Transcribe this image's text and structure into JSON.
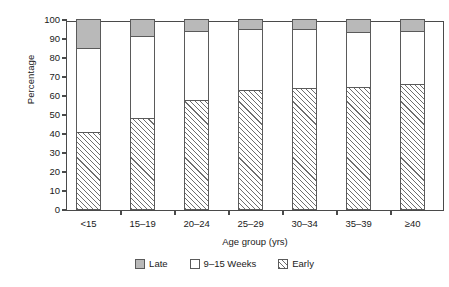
{
  "chart_data": {
    "type": "bar",
    "subtype": "stacked-percentage",
    "title": "",
    "xlabel": "Age group (yrs)",
    "ylabel": "Percentage",
    "ylim": [
      0,
      100
    ],
    "yticks": [
      0,
      10,
      20,
      30,
      40,
      50,
      60,
      70,
      80,
      90,
      100
    ],
    "ytick_labels": [
      "0",
      "10",
      "20",
      "30",
      "40",
      "50",
      "60",
      "70",
      "80",
      "90",
      "100"
    ],
    "grid": false,
    "legend_position": "bottom-center",
    "categories": [
      "<15",
      "15–19",
      "20–24",
      "25–29",
      "30–34",
      "35–39",
      "≥40"
    ],
    "series": [
      {
        "name": "Early",
        "fill": "hatched",
        "color": "#ffffff",
        "values": [
          40.5,
          48.0,
          57.5,
          62.5,
          63.5,
          64.0,
          66.0
        ]
      },
      {
        "name": "9–15 Weeks",
        "fill": "solid",
        "color": "#ffffff",
        "values": [
          44.5,
          43.0,
          36.0,
          32.0,
          31.0,
          29.0,
          27.5
        ]
      },
      {
        "name": "Late",
        "fill": "solid",
        "color": "#b9b9b9",
        "values": [
          15.0,
          9.0,
          6.5,
          5.5,
          5.5,
          7.0,
          6.5
        ]
      }
    ]
  },
  "legend": {
    "items": [
      {
        "label": "Late",
        "swatch": "gray-swatch"
      },
      {
        "label": "9–15 Weeks",
        "swatch": "white-swatch"
      },
      {
        "label": "Early",
        "swatch": "hatched-swatch"
      }
    ]
  },
  "colors": {
    "late": "#b9b9b9",
    "mid": "#ffffff",
    "early_hatch": "#6e6e6e",
    "axis": "#4a4a4a",
    "text": "#1a1a1a"
  }
}
